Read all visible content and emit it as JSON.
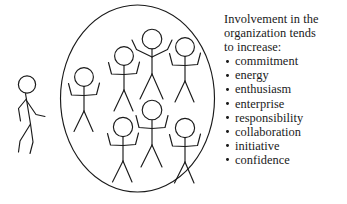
{
  "figure": {
    "caption_heading_lines": [
      "Involvement in the",
      "organization tends",
      "to increase:"
    ],
    "bullets": [
      "commitment",
      "energy",
      "enthusiasm",
      "enterprise",
      "responsibility",
      "collaboration",
      "initiative",
      "confidence"
    ],
    "diagram": {
      "stroke_color": "#1a1a1a",
      "background_color": "#ffffff",
      "group_circle_label": "organization",
      "people_inside_count": 7,
      "people_outside_count": 1,
      "outside_person_pose": "walking-toward-group",
      "inside_person_pose": "arms-raised-celebrating"
    }
  }
}
